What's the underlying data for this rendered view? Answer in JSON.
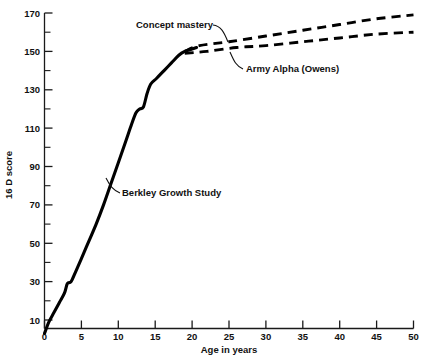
{
  "chart_data": {
    "type": "line",
    "title": "",
    "xlabel": "Age in years",
    "ylabel": "16 D score",
    "xlim": [
      0,
      50
    ],
    "ylim": [
      0,
      170
    ],
    "grid": false,
    "legend_position": "inline-annotations",
    "x_ticks": [
      "0",
      "5",
      "10",
      "15",
      "20",
      "25",
      "30",
      "35",
      "40",
      "45",
      "50"
    ],
    "x_tick_values": [
      0,
      5,
      10,
      15,
      20,
      25,
      30,
      35,
      40,
      45,
      50
    ],
    "x_minor_ticks": [
      2.5,
      7.5,
      12.5,
      17.5,
      22.5,
      27.5,
      32.5,
      37.5,
      42.5,
      47.5
    ],
    "y_ticks": [
      "10",
      "30",
      "50",
      "70",
      "90",
      "110",
      "130",
      "150",
      "170"
    ],
    "y_tick_values": [
      10,
      30,
      50,
      70,
      90,
      110,
      130,
      150,
      170
    ],
    "y_minor_ticks": [
      20,
      40,
      60,
      80,
      100,
      120,
      140,
      160
    ],
    "series": [
      {
        "name": "Berkley Growth Study",
        "style": "solid",
        "annotation": "Berkley Growth Study",
        "points": [
          [
            0.0,
            3
          ],
          [
            0.6,
            9
          ],
          [
            1.3,
            14
          ],
          [
            2.0,
            19
          ],
          [
            2.7,
            24
          ],
          [
            3.1,
            29
          ],
          [
            3.6,
            30
          ],
          [
            4.2,
            35
          ],
          [
            5.0,
            42
          ],
          [
            6.0,
            51
          ],
          [
            7.0,
            60
          ],
          [
            8.0,
            70
          ],
          [
            9.0,
            81
          ],
          [
            10.0,
            92
          ],
          [
            11.0,
            103
          ],
          [
            11.8,
            112
          ],
          [
            12.4,
            118
          ],
          [
            12.9,
            120
          ],
          [
            13.4,
            121
          ],
          [
            13.9,
            128
          ],
          [
            14.4,
            133
          ],
          [
            15.2,
            136
          ],
          [
            16.2,
            140
          ],
          [
            17.2,
            144
          ],
          [
            18.2,
            148
          ],
          [
            19.0,
            150
          ],
          [
            19.8,
            151
          ],
          [
            20.6,
            152
          ]
        ]
      },
      {
        "name": "Concept mastery",
        "style": "dashed",
        "annotation": "Concept mastery",
        "points": [
          [
            19.0,
            150
          ],
          [
            21.0,
            153
          ],
          [
            25.0,
            155
          ],
          [
            30.0,
            158
          ],
          [
            35.0,
            161
          ],
          [
            40.0,
            164
          ],
          [
            45.0,
            167
          ],
          [
            50.0,
            169
          ]
        ]
      },
      {
        "name": "Army Alpha (Owens)",
        "style": "dashed",
        "annotation": "Army Alpha (Owens)",
        "points": [
          [
            19.0,
            149
          ],
          [
            22.0,
            150
          ],
          [
            26.0,
            152
          ],
          [
            30.0,
            153
          ],
          [
            35.0,
            155
          ],
          [
            40.0,
            157
          ],
          [
            45.0,
            159
          ],
          [
            50.0,
            160
          ]
        ]
      }
    ],
    "annotations": [
      {
        "text": "Concept mastery",
        "x": 136,
        "y": 28
      },
      {
        "text": "Army Alpha (Owens)",
        "x": 246,
        "y": 72
      },
      {
        "text": "Berkley Growth Study",
        "x": 122,
        "y": 196
      }
    ]
  }
}
